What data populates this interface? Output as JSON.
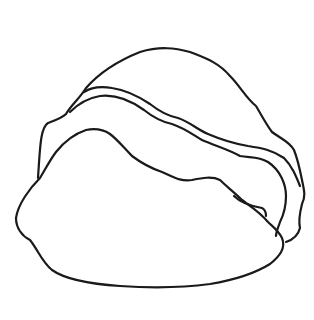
{
  "image": {
    "subject": "rock",
    "style": "line-drawing",
    "background_color": "#ffffff",
    "stroke_color": "#1a1a1a",
    "parts": [
      "rock-top-outline",
      "rock-ridge-line-upper",
      "rock-ridge-line-lower",
      "rock-front-face",
      "rock-side-crack"
    ]
  }
}
